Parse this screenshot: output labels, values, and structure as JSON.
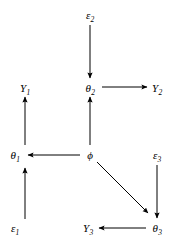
{
  "diagram": {
    "type": "path-diagram",
    "background_color": "#ffffff",
    "line_color": "#000000",
    "width": 178,
    "height": 243,
    "nodes": [
      {
        "id": "eps2",
        "base": "ε",
        "sub": "2",
        "label": "ε₂",
        "x": 90,
        "y": 15
      },
      {
        "id": "Y1",
        "base": "Y",
        "sub": "1",
        "label": "Y₁",
        "x": 25,
        "y": 88
      },
      {
        "id": "theta2",
        "base": "θ",
        "sub": "2",
        "label": "θ₂",
        "x": 90,
        "y": 88
      },
      {
        "id": "Y2",
        "base": "Y",
        "sub": "2",
        "label": "Y₂",
        "x": 157,
        "y": 88
      },
      {
        "id": "theta1",
        "base": "θ",
        "sub": "1",
        "label": "θ₁",
        "x": 15,
        "y": 155
      },
      {
        "id": "phi",
        "base": "ϕ",
        "sub": "",
        "label": "ϕ",
        "x": 90,
        "y": 155
      },
      {
        "id": "eps3",
        "base": "ε",
        "sub": "3",
        "label": "ε₃",
        "x": 157,
        "y": 155
      },
      {
        "id": "eps1",
        "base": "ε",
        "sub": "1",
        "label": "ε₁",
        "x": 15,
        "y": 228
      },
      {
        "id": "Y3",
        "base": "Y",
        "sub": "3",
        "label": "Y₃",
        "x": 88,
        "y": 228
      },
      {
        "id": "theta3",
        "base": "θ",
        "sub": "3",
        "label": "θ₃",
        "x": 157,
        "y": 228
      }
    ],
    "edges": [
      {
        "id": "eps2-to-theta2",
        "from": "eps2",
        "to": "theta2",
        "direction": "down",
        "x1": 90,
        "y1": 25,
        "x2": 90,
        "y2": 78
      },
      {
        "id": "phi-to-theta2",
        "from": "phi",
        "to": "theta2",
        "direction": "up",
        "x1": 90,
        "y1": 145,
        "x2": 90,
        "y2": 97
      },
      {
        "id": "theta2-to-Y2",
        "from": "theta2",
        "to": "Y2",
        "direction": "right",
        "x1": 102,
        "y1": 87,
        "x2": 147,
        "y2": 87
      },
      {
        "id": "theta1-to-Y1",
        "from": "theta1",
        "to": "Y1",
        "direction": "up",
        "x1": 25,
        "y1": 145,
        "x2": 25,
        "y2": 97
      },
      {
        "id": "eps1-to-theta1",
        "from": "eps1",
        "to": "theta1",
        "direction": "up",
        "x1": 25,
        "y1": 219,
        "x2": 25,
        "y2": 168
      },
      {
        "id": "phi-to-theta1",
        "from": "phi",
        "to": "theta1",
        "direction": "left",
        "x1": 80,
        "y1": 155,
        "x2": 28,
        "y2": 155
      },
      {
        "id": "phi-to-theta3",
        "from": "phi",
        "to": "theta3",
        "direction": "diagonal-down-right",
        "x1": 97,
        "y1": 162,
        "x2": 148,
        "y2": 213
      },
      {
        "id": "eps3-to-theta3",
        "from": "eps3",
        "to": "theta3",
        "direction": "down",
        "x1": 157,
        "y1": 165,
        "x2": 157,
        "y2": 218
      },
      {
        "id": "theta3-to-Y3",
        "from": "theta3",
        "to": "Y3",
        "direction": "left",
        "x1": 146,
        "y1": 228,
        "x2": 99,
        "y2": 228
      }
    ]
  }
}
